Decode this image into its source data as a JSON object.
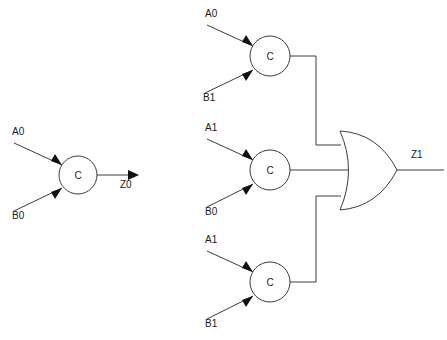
{
  "diagram": {
    "background_color": "#ffffff",
    "line_color": "#3d3d3d",
    "text_color": "#1a1a1a"
  },
  "gates": [
    {
      "id": "gate-c-z0",
      "label": "C",
      "cx": 78,
      "cy": 175,
      "r": 19,
      "inputs": [
        {
          "name": "A0",
          "label_x": 12,
          "label_y": 135,
          "from_x": 14,
          "from_y": 143,
          "to_x": 62,
          "to_y": 165
        },
        {
          "name": "B0",
          "label_x": 12,
          "label_y": 219,
          "from_x": 14,
          "from_y": 211,
          "to_x": 62,
          "to_y": 188
        }
      ]
    },
    {
      "id": "gate-c-top",
      "label": "C",
      "cx": 270,
      "cy": 56,
      "r": 20,
      "inputs": [
        {
          "name": "A0",
          "label_x": 205,
          "label_y": 17,
          "from_x": 207,
          "from_y": 25,
          "to_x": 253,
          "to_y": 46
        },
        {
          "name": "B1",
          "label_x": 203,
          "label_y": 101,
          "from_x": 205,
          "from_y": 93,
          "to_x": 253,
          "to_y": 70
        }
      ]
    },
    {
      "id": "gate-c-middle",
      "label": "C",
      "cx": 270,
      "cy": 170,
      "r": 20,
      "inputs": [
        {
          "name": "A1",
          "label_x": 205,
          "label_y": 131,
          "from_x": 207,
          "from_y": 139,
          "to_x": 253,
          "to_y": 160
        },
        {
          "name": "B0",
          "label_x": 205,
          "label_y": 215,
          "from_x": 207,
          "from_y": 207,
          "to_x": 253,
          "to_y": 184
        }
      ]
    },
    {
      "id": "gate-c-bottom",
      "label": "C",
      "cx": 270,
      "cy": 282,
      "r": 20,
      "inputs": [
        {
          "name": "A1",
          "label_x": 205,
          "label_y": 243,
          "from_x": 207,
          "from_y": 251,
          "to_x": 253,
          "to_y": 272
        },
        {
          "name": "B1",
          "label_x": 205,
          "label_y": 327,
          "from_x": 207,
          "from_y": 319,
          "to_x": 253,
          "to_y": 296
        }
      ]
    }
  ],
  "or_gate": {
    "id": "gate-or-z1",
    "left_x": 340,
    "tip_x": 397,
    "top_y": 131,
    "bottom_y": 210,
    "mid_y": 170
  },
  "outputs": [
    {
      "name": "Z0",
      "label_x": 120,
      "label_y": 187,
      "from_x": 97,
      "from_y": 175,
      "to_x": 138,
      "to_y": 175
    },
    {
      "name": "Z1",
      "label_x": 411,
      "label_y": 158,
      "from_x": 397,
      "from_y": 170,
      "to_x": 444,
      "to_y": 170
    }
  ],
  "bus": {
    "x": 316,
    "top_wire_y": 56,
    "bottom_wire_y": 282,
    "or_top_stub_y": 145,
    "or_bottom_stub_y": 196,
    "gate_out_x": 290,
    "or_edge_x": 341,
    "middle_out_from_x": 290,
    "middle_out_to_x": 352,
    "middle_out_y": 170
  }
}
